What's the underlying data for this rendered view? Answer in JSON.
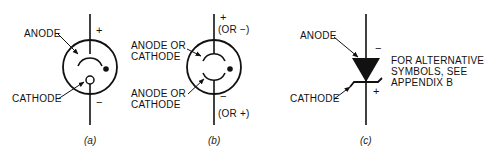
{
  "figures": [
    {
      "id": "a",
      "caption": "(a)",
      "labels": {
        "anode": "ANODE",
        "cathode": "CATHODE"
      },
      "terminals": {
        "top": "+",
        "bottom": "−"
      },
      "symbol": "gas-diode-tube"
    },
    {
      "id": "b",
      "caption": "(b)",
      "labels": {
        "upper": [
          "ANODE OR",
          "CATHODE"
        ],
        "lower": [
          "ANODE OR",
          "CATHODE"
        ]
      },
      "terminals": {
        "top": "+",
        "top_alt": "(OR −)",
        "bottom": "−",
        "bottom_alt": "(OR +)"
      },
      "symbol": "cold-cathode-diode-tube"
    },
    {
      "id": "c",
      "caption": "(c)",
      "labels": {
        "anode": "ANODE",
        "cathode": "CATHODE"
      },
      "terminals": {
        "top": "−",
        "bottom": "+"
      },
      "note": [
        "FOR ALTERNATIVE",
        "SYMBOLS, SEE",
        "APPENDIX B"
      ],
      "symbol": "zener-diode"
    }
  ],
  "colors": {
    "ink": "#111111",
    "background": "#ffffff"
  }
}
